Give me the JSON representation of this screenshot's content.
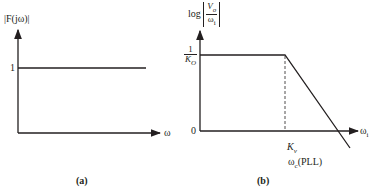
{
  "diagram": {
    "panel_a": {
      "caption": "(a)",
      "y_axis_label": "|F(jω)|",
      "y_tick_label": "1",
      "x_axis_label": "ω",
      "curve": "constant magnitude of 1 across all ω"
    },
    "panel_b": {
      "caption": "(b)",
      "y_axis_label_prefix": "log",
      "y_axis_fraction_num": "V",
      "y_axis_fraction_num_sub": "o",
      "y_axis_fraction_den": "ω",
      "y_axis_fraction_den_sub": "i",
      "y_tick_top_num": "1",
      "y_tick_top_den": "K",
      "y_tick_top_den_sub": "O",
      "y_tick_zero": "0",
      "x_axis_label": "ω",
      "x_axis_label_sub": "i",
      "break_label": "K",
      "break_label_sub": "v",
      "break_label_2": "ω",
      "break_label_2_sub": "c",
      "break_label_2_suffix": "(PLL)",
      "curve": "flat at 1/K_O until K_v, then rolls off, crossing 0 beyond K_v"
    },
    "colors": {
      "line": "#231f20",
      "background": "#ffffff"
    }
  }
}
